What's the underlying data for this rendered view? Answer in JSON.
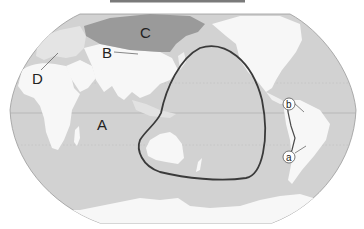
{
  "map": {
    "type": "world-map-pacific-centered",
    "colors": {
      "ocean": "#d2d2d2",
      "land": "#f7f7f7",
      "highlight_region": "#9a9a9a",
      "boundary_line": "#4a4a4a",
      "graticule": "#b0b0b0",
      "top_bar": "#7a7a7a"
    },
    "labels": {
      "A": "A",
      "B": "B",
      "C": "C",
      "D": "D",
      "a": "a",
      "b": "b"
    },
    "features": {
      "highlighted_region": "Russia / northern Asia (C)",
      "enclosed_region": "Western Pacific loop around Australia",
      "leader_lines": [
        "B",
        "D",
        "a",
        "b"
      ]
    }
  }
}
